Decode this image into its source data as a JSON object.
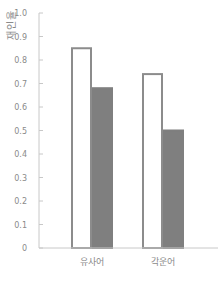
{
  "chart_data": {
    "type": "bar",
    "title": "",
    "xlabel": "",
    "ylabel": "재인율",
    "categories": [
      "유사어",
      "각운어"
    ],
    "series": [
      {
        "name": "series-1",
        "values": [
          0.85,
          0.74
        ],
        "fill": "#ffffff",
        "stroke": "#8c8c8c"
      },
      {
        "name": "series-2",
        "values": [
          0.68,
          0.5
        ],
        "fill": "#7f7f7f",
        "stroke": "#7f7f7f"
      }
    ],
    "ylim": [
      0,
      1.0
    ],
    "yticks": [
      "0",
      "0.1",
      "0.2",
      "0.3",
      "0.4",
      "0.5",
      "0.6",
      "0.7",
      "0.8",
      "0.9",
      "1.0"
    ],
    "grid": false,
    "legend": "none"
  },
  "colors": {
    "axis": "#c8c8c8",
    "text": "#8a8a8a"
  }
}
